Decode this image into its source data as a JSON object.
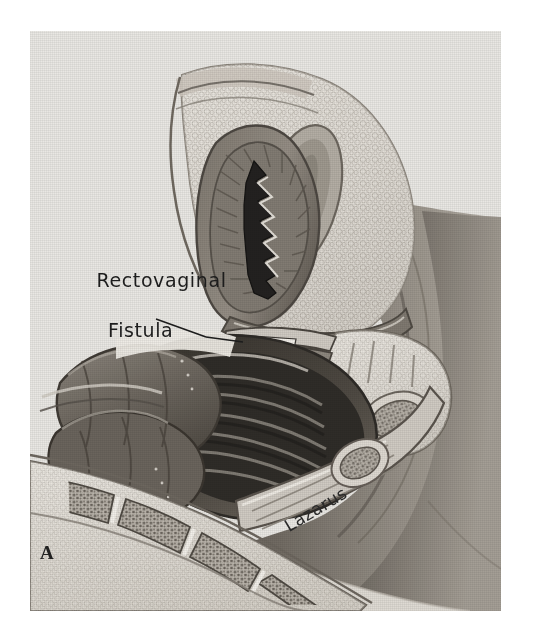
{
  "figure": {
    "panel_letter": "A",
    "artist_signature": "Lazarus",
    "background_color": "#e9e9e7",
    "page_color": "#ffffff",
    "ink_color": "#1d1d1d"
  },
  "annotations": {
    "fistula": {
      "line1": "Rectovaginal",
      "line2": "Fistula"
    }
  },
  "anatomy": {
    "structures": [
      {
        "name": "pubic-symphysis-fat-pad",
        "tone": "#d8d5cf"
      },
      {
        "name": "urethra",
        "tone": "#a9a49c"
      },
      {
        "name": "vaginal-canal",
        "tone": "#8c867e"
      },
      {
        "name": "vaginal-lumen",
        "tone": "#2b2926"
      },
      {
        "name": "vaginal-rugae",
        "tone": "#6e6860"
      },
      {
        "name": "perineal-body",
        "tone": "#cfcac2"
      },
      {
        "name": "rectum",
        "tone": "#4a4640"
      },
      {
        "name": "rectal-lumen",
        "tone": "#35322d"
      },
      {
        "name": "sigmoid-colon",
        "tone": "#6f6a62"
      },
      {
        "name": "anal-canal",
        "tone": "#7a746c"
      },
      {
        "name": "sacrum",
        "tone": "#d4d0c8"
      },
      {
        "name": "coccyx",
        "tone": "#c9c4bb"
      },
      {
        "name": "pubic-bone-marrow",
        "tone": "#8d877d"
      },
      {
        "name": "buttock-soft-tissue",
        "tone": "#6b665f"
      },
      {
        "name": "thigh-surface",
        "tone": "#9c968d"
      }
    ]
  }
}
